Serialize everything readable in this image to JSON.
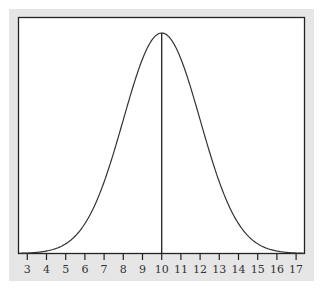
{
  "chart_data": {
    "type": "line",
    "title": "",
    "xlabel": "",
    "ylabel": "",
    "distribution": {
      "mean": 10,
      "sd": 2
    },
    "xlim": [
      2.5,
      17.4
    ],
    "x_ticks": [
      3,
      4,
      5,
      6,
      7,
      8,
      9,
      10,
      11,
      12,
      13,
      14,
      15,
      16,
      17
    ],
    "tick_labels": [
      "3",
      "4",
      "5",
      "6",
      "7",
      "8",
      "9",
      "10",
      "11",
      "12",
      "13",
      "14",
      "15",
      "16",
      "17"
    ],
    "x": [
      3,
      4,
      5,
      6,
      7,
      8,
      9,
      10,
      11,
      12,
      13,
      14,
      15,
      16,
      17
    ],
    "values": [
      0.0022,
      0.0111,
      0.0438,
      0.1353,
      0.3247,
      0.6065,
      0.8825,
      1.0,
      0.8825,
      0.6065,
      0.3247,
      0.1353,
      0.0438,
      0.0111,
      0.0022
    ],
    "annotations": [
      {
        "type": "vertical-line",
        "x": 10
      }
    ],
    "grid": false,
    "legend": null
  },
  "colors": {
    "panel": "#e6e6e6",
    "plot_bg": "#ffffff",
    "line": "#333333",
    "axis": "#222222",
    "text": "#333333"
  }
}
